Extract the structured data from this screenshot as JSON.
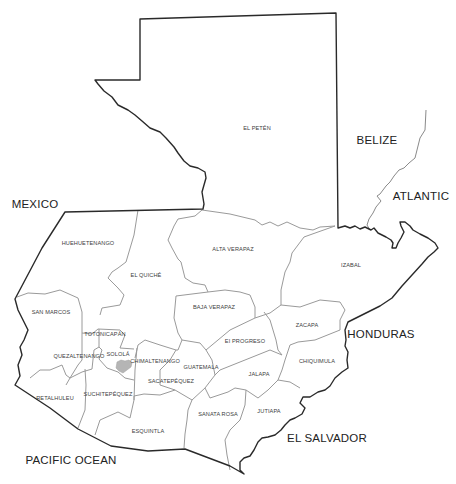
{
  "map": {
    "title": "Guatemala departments",
    "colors": {
      "national_border": "#2a2a2a",
      "department_border": "#9a9a9a",
      "lake": "#b5b5b5",
      "background": "#ffffff"
    },
    "departments": [
      {
        "name": "EL PETÉN",
        "x": 257,
        "y": 128
      },
      {
        "name": "HUEHUETENANGO",
        "x": 88,
        "y": 243
      },
      {
        "name": "EL QUICHÉ",
        "x": 146,
        "y": 275
      },
      {
        "name": "ALTA VERAPAZ",
        "x": 233,
        "y": 249
      },
      {
        "name": "IZABAL",
        "x": 351,
        "y": 265
      },
      {
        "name": "BAJA VERAPAZ",
        "x": 214,
        "y": 307
      },
      {
        "name": "SAN MARCOS",
        "x": 51,
        "y": 312
      },
      {
        "name": "TOTONICAPÁN",
        "x": 105,
        "y": 334
      },
      {
        "name": "QUEZALTENANGO",
        "x": 79,
        "y": 356
      },
      {
        "name": "SOLOLÁ",
        "x": 118,
        "y": 354
      },
      {
        "name": "CHIMALTENANGO",
        "x": 155,
        "y": 361
      },
      {
        "name": "SACATEPÉQUEZ",
        "x": 171,
        "y": 381
      },
      {
        "name": "GUATEMALA",
        "x": 201,
        "y": 367
      },
      {
        "name": "EI PROGRESO",
        "x": 245,
        "y": 341
      },
      {
        "name": "ZACAPA",
        "x": 307,
        "y": 325
      },
      {
        "name": "CHIQUIMULA",
        "x": 317,
        "y": 361
      },
      {
        "name": "JALAPA",
        "x": 259,
        "y": 374
      },
      {
        "name": "RETALHULEU",
        "x": 55,
        "y": 398
      },
      {
        "name": "SUCHITEPÉQUEZ",
        "x": 108,
        "y": 394
      },
      {
        "name": "SANATA ROSA",
        "x": 218,
        "y": 414
      },
      {
        "name": "JUTIAPA",
        "x": 269,
        "y": 411
      },
      {
        "name": "ESQUINTLA",
        "x": 148,
        "y": 431
      }
    ],
    "neighbors": [
      {
        "name": "MEXICO",
        "x": 35,
        "y": 204
      },
      {
        "name": "BELIZE",
        "x": 377,
        "y": 140
      },
      {
        "name": "ATLANTIC",
        "x": 421,
        "y": 196
      },
      {
        "name": "HONDURAS",
        "x": 381,
        "y": 334
      },
      {
        "name": "EL SALVADOR",
        "x": 327,
        "y": 438
      },
      {
        "name": "PACIFIC OCEAN",
        "x": 71,
        "y": 460
      }
    ],
    "features": [
      {
        "name": "Lake Atitlán",
        "type": "lake"
      }
    ]
  }
}
